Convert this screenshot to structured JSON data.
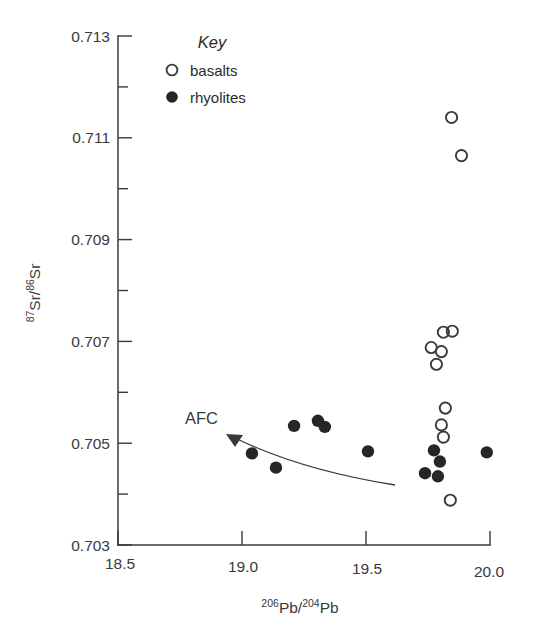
{
  "figure": {
    "background": "#ffffff",
    "ink_color": "#3a3a3a"
  },
  "chart_data": {
    "type": "scatter",
    "title": "",
    "xlabel": "206Pb/204Pb",
    "ylabel": "87Sr/86Sr",
    "xlabel_parts": {
      "sup1": "206",
      "base1": "Pb/",
      "sup2": "204",
      "base2": "Pb"
    },
    "ylabel_parts": {
      "sup1": "87",
      "base1": "Sr/",
      "sup2": "86",
      "base2": "Sr"
    },
    "xlim": [
      18.5,
      20.0
    ],
    "ylim": [
      0.703,
      0.713
    ],
    "grid": false,
    "x_ticks": [
      18.5,
      19.0,
      19.5,
      20.0
    ],
    "x_tick_labels": [
      "18.5",
      "19.0",
      "19.5",
      "20.0"
    ],
    "y_ticks": [
      0.703,
      0.704,
      0.705,
      0.706,
      0.707,
      0.708,
      0.709,
      0.71,
      0.711,
      0.712,
      0.713
    ],
    "y_tick_labels": [
      "0.703",
      "",
      "0.705",
      "",
      "0.707",
      "",
      "0.709",
      "",
      "0.711",
      "",
      "0.713"
    ],
    "legend_position": "top-center",
    "series": [
      {
        "name": "basalts",
        "marker": "open-circle",
        "color": "#3b3b3b",
        "points": [
          [
            19.845,
            0.7114
          ],
          [
            19.885,
            0.71065
          ],
          [
            19.812,
            0.70718
          ],
          [
            19.848,
            0.7072
          ],
          [
            19.763,
            0.70688
          ],
          [
            19.804,
            0.7068
          ],
          [
            19.784,
            0.70655
          ],
          [
            19.82,
            0.70569
          ],
          [
            19.804,
            0.70536
          ],
          [
            19.812,
            0.70512
          ],
          [
            19.84,
            0.70388
          ]
        ]
      },
      {
        "name": "rhyolites",
        "marker": "filled-circle",
        "color": "#262626",
        "points": [
          [
            19.21,
            0.70534
          ],
          [
            19.306,
            0.70544
          ],
          [
            19.334,
            0.70532
          ],
          [
            19.04,
            0.7048
          ],
          [
            19.137,
            0.70452
          ],
          [
            19.508,
            0.70484
          ],
          [
            19.987,
            0.70482
          ],
          [
            19.774,
            0.70486
          ],
          [
            19.798,
            0.70464
          ],
          [
            19.738,
            0.70441
          ],
          [
            19.79,
            0.70435
          ]
        ]
      }
    ],
    "annotations": [
      {
        "name": "afc-arrow",
        "label": "AFC",
        "label_x": 19.085,
        "label_y": 0.70565,
        "curve_start": [
          19.617,
          0.70403
        ],
        "curve_control": [
          19.3,
          0.7048
        ],
        "curve_end": [
          18.945,
          0.70531
        ],
        "arrow_at_end": true
      }
    ]
  },
  "legend": {
    "title": "Key",
    "entries": [
      {
        "marker": "open-circle",
        "label": "basalts"
      },
      {
        "marker": "filled-circle",
        "label": "rhyolites"
      }
    ]
  }
}
